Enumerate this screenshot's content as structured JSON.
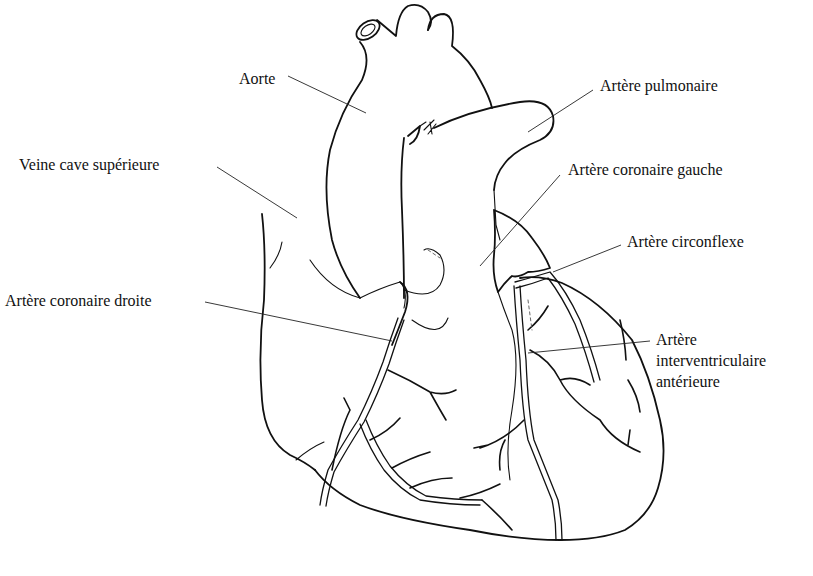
{
  "diagram": {
    "line_color": "#111111",
    "background": "#ffffff",
    "labels": [
      {
        "id": "aorte",
        "lines": [
          "Aorte"
        ],
        "x": 239,
        "y": 69,
        "leader": [
          288,
          76,
          366,
          113
        ]
      },
      {
        "id": "veine-cave-superieure",
        "lines": [
          "Veine cave supérieure"
        ],
        "x": 19,
        "y": 155,
        "leader": [
          217,
          167,
          297,
          218
        ]
      },
      {
        "id": "artere-pulmonaire",
        "lines": [
          "Artère pulmonaire"
        ],
        "x": 600,
        "y": 76,
        "leader": [
          593,
          90,
          528,
          132
        ]
      },
      {
        "id": "artere-coronaire-gauche",
        "lines": [
          "Artère coronaire gauche"
        ],
        "x": 568,
        "y": 160,
        "leader": [
          560,
          175,
          480,
          266
        ]
      },
      {
        "id": "artere-circonflexe",
        "lines": [
          "Artère circonflexe"
        ],
        "x": 627,
        "y": 232,
        "leader": [
          621,
          245,
          553,
          272
        ]
      },
      {
        "id": "artere-coronaire-droite",
        "lines": [
          "Artère coronaire droite"
        ],
        "x": 5,
        "y": 291,
        "leader": [
          205,
          302,
          392,
          341
        ]
      },
      {
        "id": "artere-interventriculaire-anterieure",
        "lines": [
          "Artère",
          "interventriculaire",
          "antérieure"
        ],
        "x": 656,
        "y": 330,
        "leader": [
          650,
          341,
          528,
          353
        ]
      }
    ]
  }
}
